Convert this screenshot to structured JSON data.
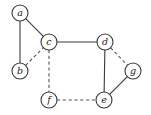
{
  "graph": {
    "node_radius": 8,
    "colors": {
      "stroke": "#3a3a3a",
      "fill": "#ffffff",
      "label": "#222222"
    },
    "nodes": [
      {
        "id": "a",
        "label": "a",
        "x": 20,
        "y": 13
      },
      {
        "id": "b",
        "label": "b",
        "x": 20,
        "y": 71
      },
      {
        "id": "c",
        "label": "c",
        "x": 49,
        "y": 42
      },
      {
        "id": "d",
        "label": "d",
        "x": 105,
        "y": 42
      },
      {
        "id": "g",
        "label": "g",
        "x": 133,
        "y": 71
      },
      {
        "id": "f",
        "label": "f",
        "x": 49,
        "y": 100
      },
      {
        "id": "e",
        "label": "e",
        "x": 104,
        "y": 100
      }
    ],
    "edges": [
      {
        "from": "a",
        "to": "b",
        "style": "solid"
      },
      {
        "from": "a",
        "to": "c",
        "style": "solid"
      },
      {
        "from": "c",
        "to": "d",
        "style": "solid"
      },
      {
        "from": "d",
        "to": "e",
        "style": "solid"
      },
      {
        "from": "e",
        "to": "g",
        "style": "solid"
      },
      {
        "from": "b",
        "to": "c",
        "style": "dashed"
      },
      {
        "from": "c",
        "to": "f",
        "style": "dashed"
      },
      {
        "from": "f",
        "to": "e",
        "style": "dashed"
      },
      {
        "from": "d",
        "to": "g",
        "style": "dashed"
      }
    ]
  }
}
